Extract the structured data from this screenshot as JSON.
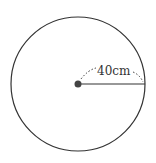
{
  "diagram": {
    "shape": "circle",
    "radius_label": "40cm",
    "colors": {
      "stroke": "#333333",
      "center_dot": "#444444",
      "background": "#ffffff"
    }
  }
}
